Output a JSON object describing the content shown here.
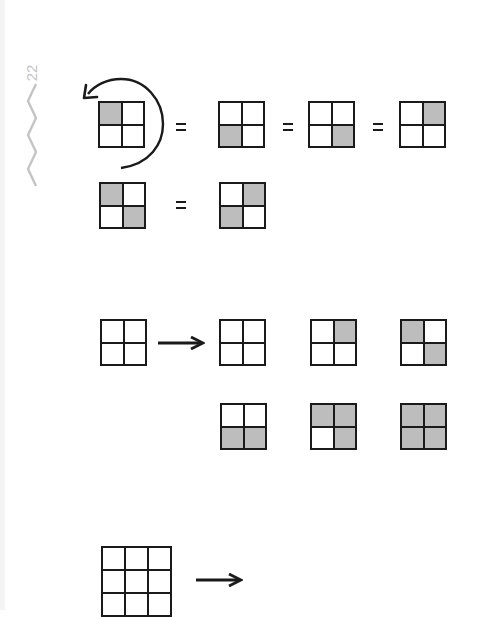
{
  "page": {
    "page_number": "22",
    "shade_color": "#bdbdbd",
    "line_color": "#1a1a1a",
    "margin_mark_color": "#c4c4c4"
  },
  "figures": {
    "rotation_equivalence": {
      "rotation_direction": "counterclockwise",
      "rows": [
        {
          "separator": "=",
          "grids": [
            {
              "size": 2,
              "shaded": [
                [
                  1,
                  0
                ],
                [
                  0,
                  0
                ]
              ]
            },
            {
              "size": 2,
              "shaded": [
                [
                  0,
                  0
                ],
                [
                  1,
                  0
                ]
              ]
            },
            {
              "size": 2,
              "shaded": [
                [
                  0,
                  0
                ],
                [
                  0,
                  1
                ]
              ]
            },
            {
              "size": 2,
              "shaded": [
                [
                  0,
                  1
                ],
                [
                  0,
                  0
                ]
              ]
            }
          ]
        },
        {
          "separator": "=",
          "grids": [
            {
              "size": 2,
              "shaded": [
                [
                  1,
                  0
                ],
                [
                  0,
                  1
                ]
              ]
            },
            {
              "size": 2,
              "shaded": [
                [
                  0,
                  1
                ],
                [
                  1,
                  0
                ]
              ]
            }
          ]
        }
      ]
    },
    "two_by_two_colorings": {
      "source": {
        "size": 2,
        "shaded": [
          [
            0,
            0
          ],
          [
            0,
            0
          ]
        ]
      },
      "results": [
        {
          "size": 2,
          "shaded": [
            [
              0,
              0
            ],
            [
              0,
              0
            ]
          ]
        },
        {
          "size": 2,
          "shaded": [
            [
              0,
              1
            ],
            [
              0,
              0
            ]
          ]
        },
        {
          "size": 2,
          "shaded": [
            [
              1,
              0
            ],
            [
              0,
              1
            ]
          ]
        },
        {
          "size": 2,
          "shaded": [
            [
              0,
              0
            ],
            [
              1,
              1
            ]
          ]
        },
        {
          "size": 2,
          "shaded": [
            [
              1,
              1
            ],
            [
              0,
              1
            ]
          ]
        },
        {
          "size": 2,
          "shaded": [
            [
              1,
              1
            ],
            [
              1,
              1
            ]
          ]
        }
      ]
    },
    "three_by_three": {
      "source": {
        "size": 3,
        "shaded": [
          [
            0,
            0,
            0
          ],
          [
            0,
            0,
            0
          ],
          [
            0,
            0,
            0
          ]
        ]
      }
    }
  }
}
